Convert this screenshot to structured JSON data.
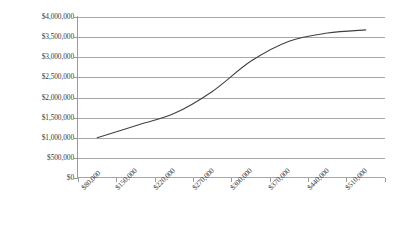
{
  "chart_data": {
    "type": "line",
    "title": "",
    "xlabel": "",
    "ylabel": "",
    "grid": true,
    "legend": false,
    "categories": [
      "$80,000",
      "$150,000",
      "$220,000",
      "$270,000",
      "$300,000",
      "$370,000",
      "$440,000",
      "$510,000"
    ],
    "values": [
      1000000,
      1300000,
      1600000,
      2150000,
      2900000,
      3400000,
      3600000,
      3680000
    ],
    "ylim": [
      0,
      4000000
    ],
    "ytick_labels": [
      "$4,000,000",
      "$3,500,000",
      "$3,000,000",
      "$2,500,000",
      "$2,000,000",
      "$1,500,000",
      "$1,000,000",
      "$500,000",
      "$0"
    ],
    "ytick_values": [
      4000000,
      3500000,
      3000000,
      2500000,
      2000000,
      1500000,
      1000000,
      500000,
      0
    ],
    "series": [
      {
        "name": "",
        "values": [
          1000000,
          1300000,
          1600000,
          2150000,
          2900000,
          3400000,
          3600000,
          3680000
        ]
      }
    ],
    "colors": {
      "line": "#404040",
      "gridline": "#a6a6a6",
      "axis": "#9a9a9a",
      "background": "#ffffff",
      "text": "#3a3a3a"
    }
  }
}
